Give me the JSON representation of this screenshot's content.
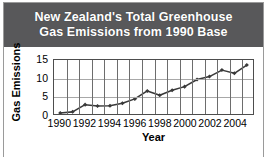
{
  "figure": {
    "title_lines": [
      "New Zealand's Total Greenhouse",
      "Gas Emissions from 1990 Base"
    ],
    "title_bg": "#58585a",
    "title_color": "#ffffff",
    "frame_color": "#9a9a9a",
    "plot_border_color": "#4d4d4d",
    "gridline_color": "#a8a8a8",
    "series_color": "#3a3a3a"
  },
  "chart_data": {
    "type": "line",
    "title": "New Zealand's Total Greenhouse Gas Emissions from 1990 Base",
    "xlabel": "Year",
    "ylabel": "Gas Emissions",
    "x": [
      1990,
      1991,
      1992,
      1993,
      1994,
      1995,
      1996,
      1997,
      1998,
      1999,
      2000,
      2001,
      2002,
      2003,
      2004,
      2005
    ],
    "values": [
      0.3,
      0.6,
      2.6,
      2.2,
      2.3,
      3.0,
      4.2,
      6.4,
      5.2,
      6.6,
      7.6,
      9.6,
      10.4,
      12.2,
      11.3,
      13.6
    ],
    "xlim": [
      1989.5,
      2005.5
    ],
    "ylim": [
      0,
      15
    ],
    "yticks": [
      0,
      5,
      10,
      15
    ],
    "xticks": [
      1990,
      1992,
      1994,
      1996,
      1998,
      2000,
      2002,
      2004
    ],
    "xtick_labels": [
      "1990",
      "1992",
      "1994",
      "1996",
      "1998",
      "2000",
      "2002",
      "2004"
    ],
    "ytick_labels": [
      "0",
      "5",
      "10",
      "15"
    ],
    "grid": "both",
    "legend": "none",
    "markers": "diamond"
  }
}
